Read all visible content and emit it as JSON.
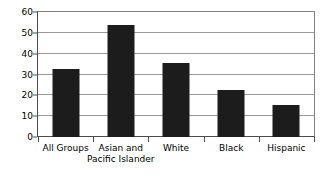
{
  "chart_data": {
    "type": "bar",
    "title": "",
    "subtitle": "",
    "xlabel": "",
    "ylabel": "",
    "categories": [
      "All Groups",
      "Asian and Pacific Islander",
      "White",
      "Black",
      "Hispanic"
    ],
    "category_lines": [
      [
        "All Groups"
      ],
      [
        "Asian and",
        "Pacific Islander"
      ],
      [
        "White"
      ],
      [
        "Black"
      ],
      [
        "Hispanic"
      ]
    ],
    "values": [
      32.7,
      53.6,
      35.6,
      22.7,
      15.5
    ],
    "ylim": [
      0,
      60
    ],
    "yticks": [
      0,
      10,
      20,
      30,
      40,
      50,
      60
    ],
    "ytick_labels": [
      "0",
      "10",
      "20",
      "30",
      "40",
      "50",
      "60"
    ],
    "grid": true,
    "grid_axis": "y",
    "legend": false,
    "legend_position": "none",
    "bar_color": "#1c1c1c",
    "grid_color": "#9a9a9a",
    "axis_color": "#4d4d4d",
    "background_color": "#ffffff"
  }
}
